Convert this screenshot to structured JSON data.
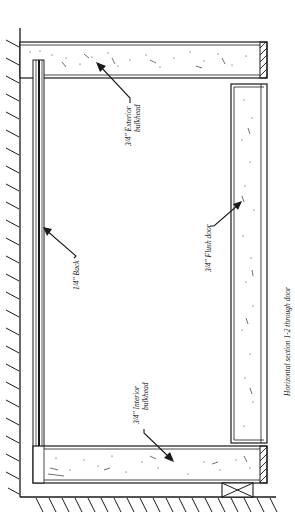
{
  "diagram": {
    "title": "Horizontal section 1-2 through door",
    "labels": {
      "exterior_bulkhead_line1": "3/4\" Exterior",
      "exterior_bulkhead_line2": "bulkhead",
      "back": "1/4\" Back",
      "flush_door": "3/4\" Flush door",
      "interior_bulkhead_line1": "3/4\" Interior",
      "interior_bulkhead_line2": "bulkhead"
    },
    "colors": {
      "ink": "#1a1a1a",
      "background": "#ffffff"
    },
    "components": [
      "wall",
      "floor",
      "exterior-bulkhead",
      "back-panel",
      "interior-bulkhead",
      "flush-door",
      "spacer-block"
    ]
  }
}
